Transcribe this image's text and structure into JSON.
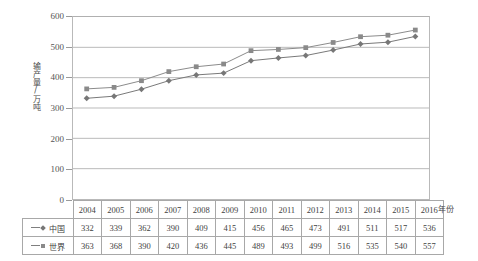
{
  "chart_data": {
    "type": "line",
    "title": "",
    "xlabel": "年份",
    "ylabel": "输产量/万吨",
    "categories": [
      "2004",
      "2005",
      "2006",
      "2007",
      "2008",
      "2009",
      "2010",
      "2011",
      "2012",
      "2013",
      "2014",
      "2015",
      "2016"
    ],
    "series": [
      {
        "name": "中国",
        "marker": "diamond",
        "color": "#777777",
        "values": [
          332,
          339,
          362,
          390,
          409,
          415,
          456,
          465,
          473,
          491,
          511,
          517,
          536
        ]
      },
      {
        "name": "世界",
        "marker": "square",
        "color": "#8a8a8a",
        "values": [
          363,
          368,
          390,
          420,
          436,
          445,
          489,
          493,
          499,
          516,
          535,
          540,
          557
        ]
      }
    ],
    "ylim": [
      0,
      600
    ],
    "yticks": [
      0,
      100,
      200,
      300,
      400,
      500,
      600
    ],
    "ytick_labels": [
      "0",
      "100",
      "200",
      "300",
      "400",
      "500",
      "600"
    ],
    "grid": true,
    "grid_color": "#b9b9b9",
    "legend_position": "table-row-labels"
  },
  "table": {
    "year_header_label": "",
    "rows": [
      {
        "label": "中国",
        "marker": "diamond"
      },
      {
        "label": "世界",
        "marker": "square"
      }
    ]
  }
}
